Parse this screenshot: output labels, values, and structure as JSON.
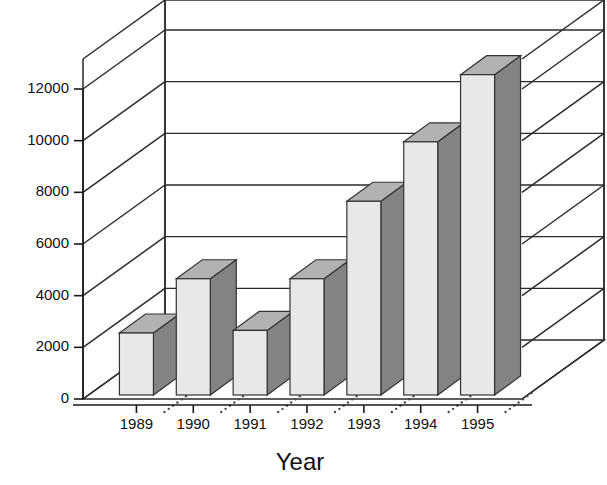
{
  "chart_data": {
    "type": "bar",
    "title": "",
    "subtitle": "",
    "xlabel": "Year",
    "ylabel": "",
    "categories": [
      "1989",
      "1990",
      "1991",
      "1992",
      "1993",
      "1994",
      "1995"
    ],
    "values": [
      2400,
      4500,
      2500,
      4500,
      7500,
      9800,
      12400
    ],
    "series": [
      {
        "name": "",
        "values": [
          2400,
          4500,
          2500,
          4500,
          7500,
          9800,
          12400
        ]
      }
    ],
    "ylim": [
      0,
      14000
    ],
    "ytick_values": [
      0,
      2000,
      4000,
      6000,
      8000,
      10000,
      12000
    ],
    "ytick_labels": [
      "0",
      "2000",
      "4000",
      "6000",
      "8000",
      "10000",
      "12000"
    ],
    "grid": true,
    "grid_axis": "y",
    "legend": false,
    "legend_position": "none",
    "three_d": true,
    "annotations": []
  },
  "style": {
    "bar_front_color": "#e8e8e8",
    "bar_side_color": "#838383",
    "bar_top_color": "#b2b2b2",
    "outline_color": "#333333",
    "axis_color": "#1a1a1a",
    "grid_color": "#2b2b2b",
    "background_color": "#ffffff",
    "text_color": "#111111"
  },
  "axes": {
    "y_axis_name": "value-axis",
    "x_axis_name": "year-axis"
  }
}
